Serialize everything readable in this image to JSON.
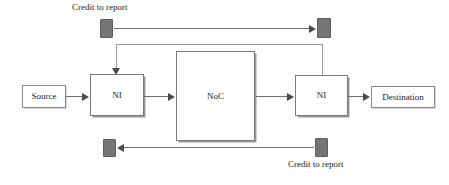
{
  "diagram": {
    "colors": {
      "background": "#ffffff",
      "box_border": "#6e6e6e",
      "box_fill": "#ffffff",
      "credit_fill": "#757575",
      "credit_border": "#5e5e5e",
      "line": "#6f6f6f",
      "line_light": "#9c9c9c",
      "arrow": "#4a4a4a",
      "text": "#1d1d1d"
    },
    "nodes": [
      {
        "id": "source",
        "label": "Source"
      },
      {
        "id": "ni-left",
        "label": "NI"
      },
      {
        "id": "noc",
        "label": "NoC"
      },
      {
        "id": "ni-right",
        "label": "NI"
      },
      {
        "id": "destination",
        "label": "Destination"
      }
    ],
    "labels": {
      "credit_top": "Credit to report",
      "credit_bottom": "Credit to report"
    },
    "credit_markers": [
      {
        "id": "credit-top-left",
        "position": "top-left"
      },
      {
        "id": "credit-top-right",
        "position": "top-right"
      },
      {
        "id": "credit-bottom-left",
        "position": "bottom-left"
      },
      {
        "id": "credit-bottom-right",
        "position": "bottom-right"
      }
    ],
    "connections": [
      {
        "id": "source-to-ni-left",
        "from": "source",
        "to": "ni-left",
        "direction": "right"
      },
      {
        "id": "ni-left-to-noc",
        "from": "ni-left",
        "to": "noc",
        "direction": "right"
      },
      {
        "id": "noc-to-ni-right",
        "from": "noc",
        "to": "ni-right",
        "direction": "right"
      },
      {
        "id": "ni-right-to-destination",
        "from": "ni-right",
        "to": "destination",
        "direction": "right"
      },
      {
        "id": "credit-top-flow",
        "from": "credit-top-left",
        "to": "credit-top-right",
        "direction": "right"
      },
      {
        "id": "credit-bottom-flow",
        "from": "credit-bottom-right",
        "to": "credit-bottom-left",
        "direction": "left"
      },
      {
        "id": "ni-right-feedback-to-ni-left",
        "from": "ni-right",
        "to": "ni-left",
        "direction": "down"
      }
    ]
  }
}
